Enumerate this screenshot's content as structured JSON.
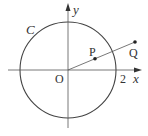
{
  "diagram": {
    "type": "geometry",
    "colors": {
      "stroke": "#444444",
      "text": "#333333",
      "background": "#ffffff"
    },
    "origin": {
      "label": "O"
    },
    "axes": {
      "x": {
        "label": "x",
        "tick_label": "2"
      },
      "y": {
        "label": "y"
      }
    },
    "circle": {
      "label": "C",
      "radius_value": 2
    },
    "points": [
      {
        "name": "P",
        "label": "P"
      },
      {
        "name": "Q",
        "label": "Q"
      }
    ]
  }
}
